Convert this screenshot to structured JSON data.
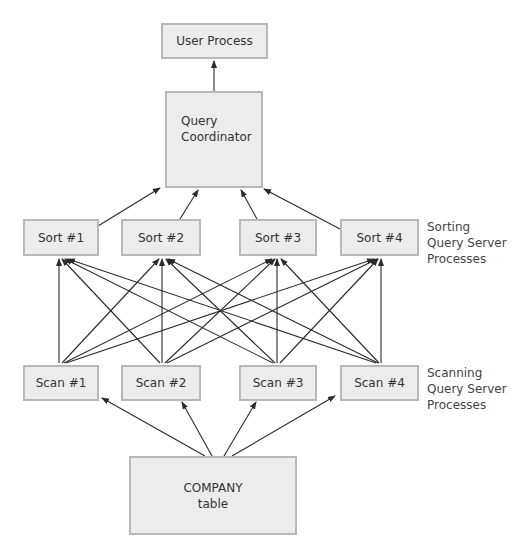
{
  "diagram": {
    "user_process": "User Process",
    "query_coordinator": [
      "Query",
      "Coordinator"
    ],
    "sort_nodes": [
      "Sort #1",
      "Sort #2",
      "Sort #3",
      "Sort #4"
    ],
    "scan_nodes": [
      "Scan #1",
      "Scan #2",
      "Scan #3",
      "Scan #4"
    ],
    "table_node": [
      "COMPANY",
      "table"
    ],
    "sorting_label": [
      "Sorting",
      "Query Server",
      "Processes"
    ],
    "scanning_label": [
      "Scanning",
      "Query Server",
      "Processes"
    ],
    "colors": {
      "box_fill": "#ececec",
      "box_border": "#b8b8b8",
      "arrow": "#2a2a2a"
    },
    "edges": {
      "user_process_from": "Query Coordinator",
      "query_coordinator_from": [
        "Sort #1",
        "Sort #2",
        "Sort #3",
        "Sort #4"
      ],
      "each_sort_from": [
        "Scan #1",
        "Scan #2",
        "Scan #3",
        "Scan #4"
      ],
      "each_scan_from": "COMPANY table"
    }
  }
}
